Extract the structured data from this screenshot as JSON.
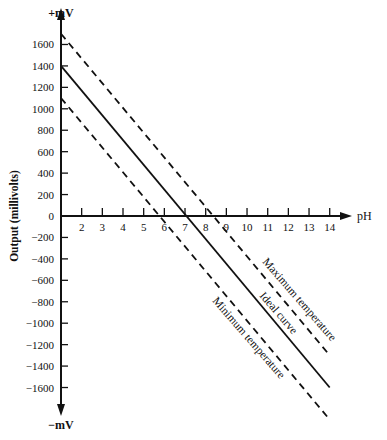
{
  "chart_data": {
    "type": "line",
    "title": "",
    "xlabel": "pH",
    "ylabel": "Output (millivolts)",
    "y_top_label": "+mV",
    "y_bottom_label": "−mV",
    "xlim": [
      1,
      14
    ],
    "ylim": [
      -1700,
      1700
    ],
    "grid": false,
    "legend": "inline labels along lines",
    "x_ticks": [
      2,
      3,
      4,
      5,
      6,
      7,
      8,
      9,
      10,
      11,
      12,
      13,
      14
    ],
    "y_ticks": [
      1600,
      1400,
      1200,
      1000,
      800,
      600,
      400,
      200,
      0,
      -200,
      -400,
      -600,
      -800,
      -1000,
      -1200,
      -1400,
      -1600
    ],
    "series": [
      {
        "name": "Maximum temperature",
        "style": "dashed",
        "x": [
          1,
          14
        ],
        "y": [
          1700,
          -1300
        ]
      },
      {
        "name": "Ideal curve",
        "style": "solid",
        "x": [
          1,
          14
        ],
        "y": [
          1400,
          -1600
        ]
      },
      {
        "name": "Minimum temperature",
        "style": "dashed",
        "x": [
          1,
          14
        ],
        "y": [
          1100,
          -1900
        ]
      }
    ],
    "annotations": [
      "Maximum temperature",
      "Ideal curve",
      "Minimum temperature"
    ]
  },
  "labels": {
    "y_top": "+mV",
    "y_bottom": "−mV",
    "x_axis": "pH",
    "y_axis": "Output (millivolts)",
    "max_temp": "Maximum temperature",
    "ideal": "Ideal curve",
    "min_temp": "Minimum temperature"
  },
  "colors": {
    "line": "#111111",
    "background": "#ffffff"
  }
}
